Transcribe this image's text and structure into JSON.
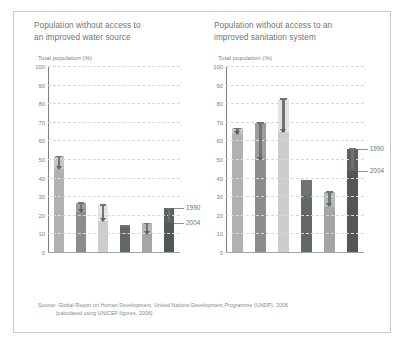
{
  "source": {
    "line1": "Source: Global Report on Human Development, United Nations Development Programme (UNDP), 2006",
    "line2": "[calculated using UNICEF figures, 2006]."
  },
  "legend": {
    "older": "1990",
    "newer": "2004"
  },
  "axis": {
    "label": "Total population (%)",
    "ticks": [
      "100",
      "90",
      "80",
      "70",
      "60",
      "50",
      "40",
      "30",
      "20",
      "10",
      "0"
    ]
  },
  "categories": [
    {
      "l1": "Sub-",
      "l2": "Saharan",
      "l3": "Africa",
      "l4": ""
    },
    {
      "l1": "Pacific",
      "l2": "and",
      "l3": "East Asia",
      "l4": ""
    },
    {
      "l1": "South",
      "l2": "Asia",
      "l3": "",
      "l4": ""
    },
    {
      "l1": "Arab",
      "l2": "States",
      "l3": "",
      "l4": ""
    },
    {
      "l1": "Latin",
      "l2": "America",
      "l3": "and",
      "l4": "Caribbean"
    },
    {
      "l1": "World",
      "l2": "",
      "l3": "",
      "l4": ""
    }
  ],
  "colors": {
    "bar_fills": [
      "#c4c6c4",
      "#9b9e9c",
      "#e4e5e2",
      "#6e7271",
      "#b5b8b5",
      "#5c605f"
    ],
    "arrow": "#6f7478",
    "grid": "#d5d9dc",
    "text": "#6d7478",
    "frame": "#c9c9c9"
  },
  "chart_data": [
    {
      "type": "bar",
      "title": "Population without access to an improved water source",
      "ylabel": "Total population (%)",
      "xlabel": "",
      "ylim": [
        0,
        100
      ],
      "yticks": [
        0,
        10,
        20,
        30,
        40,
        50,
        60,
        70,
        80,
        90,
        100
      ],
      "grid": true,
      "legend_position": "right",
      "categories": [
        "Sub-Saharan Africa",
        "Pacific and East Asia",
        "South Asia",
        "Arab States",
        "Latin America and Caribbean",
        "World"
      ],
      "series": [
        {
          "name": "1990",
          "values": [
            52,
            27,
            26,
            15,
            16,
            24
          ]
        },
        {
          "name": "2004",
          "values": [
            45,
            22,
            17,
            14,
            10,
            16
          ]
        }
      ]
    },
    {
      "type": "bar",
      "title": "Population without access to an improved sanitation system",
      "ylabel": "Total population (%)",
      "xlabel": "",
      "ylim": [
        0,
        100
      ],
      "yticks": [
        0,
        10,
        20,
        30,
        40,
        50,
        60,
        70,
        80,
        90,
        100
      ],
      "grid": true,
      "legend_position": "right",
      "categories": [
        "Sub-Saharan Africa",
        "Pacific and East Asia",
        "South Asia",
        "Arab States",
        "Latin America and Caribbean",
        "World"
      ],
      "series": [
        {
          "name": "1990",
          "values": [
            67,
            70,
            83,
            39,
            33,
            56
          ]
        },
        {
          "name": "2004",
          "values": [
            64,
            50,
            65,
            29,
            25,
            44
          ]
        }
      ]
    }
  ],
  "titles": {
    "left_l1": "Population without access to",
    "left_l2": "an improved water source",
    "right_l1": "Population without access to an",
    "right_l2": "improved sanitation system"
  }
}
